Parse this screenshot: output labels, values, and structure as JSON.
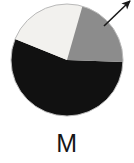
{
  "figure": {
    "label": "M",
    "label_position": "below-chart"
  },
  "colors": {
    "black_slice": "#111111",
    "white_slice": "#f2f1ee",
    "grey_slice": "#8c8c8c",
    "outline": "#b9b9b9",
    "arrow": "#1a1a1a",
    "background": "#ffffff",
    "label_text": "#161616"
  },
  "annotation": {
    "arrow_name": "leader-arrow",
    "arrow_direction": "up-right",
    "arrow_tail_x": 104,
    "arrow_tail_y": 26,
    "arrow_tip_x": 130,
    "arrow_tip_y": 1
  },
  "chart_data": {
    "type": "pie",
    "title": "M",
    "xlabel": "",
    "ylabel": "",
    "legend": "none",
    "grid": false,
    "start_angle_deg": 158,
    "direction": "clockwise",
    "center_x": 67,
    "center_y": 60,
    "radius": 56,
    "categories": [
      "black",
      "white",
      "grey"
    ],
    "values": [
      55.5,
      23.5,
      21.0
    ],
    "angles_deg": [
      200,
      84,
      76
    ],
    "series": [
      {
        "name": "M",
        "values": [
          55.5,
          23.5,
          21.0
        ]
      }
    ],
    "slices": [
      {
        "name": "black",
        "value": 55.5,
        "angle_deg": 200,
        "start_deg": 158,
        "end_deg": 358,
        "color": "#111111"
      },
      {
        "name": "white",
        "value": 23.5,
        "angle_deg": 84,
        "start_deg": 74,
        "end_deg": 158,
        "color": "#f2f1ee"
      },
      {
        "name": "grey",
        "value": 21.0,
        "angle_deg": 76,
        "start_deg": 358,
        "end_deg": 74,
        "color": "#8c8c8c"
      }
    ]
  }
}
